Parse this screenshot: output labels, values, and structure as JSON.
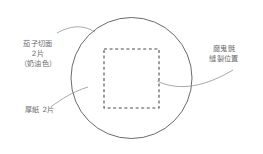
{
  "page": {
    "background_color": "#ffffff",
    "width": 263,
    "height": 154
  },
  "colors": {
    "stroke": "#595959",
    "dashed_stroke": "#4d4d4d",
    "leader": "#8c8c8c",
    "text": "#6b6b6b"
  },
  "labels": {
    "eggplant_slice": {
      "name": "茄子切面",
      "lines": [
        "茄子切面",
        "2片",
        "（奶油色）"
      ],
      "line1": "茄子切面",
      "line2": "2片",
      "line3": "（奶油色）"
    },
    "cardboard": {
      "name": "厚紙",
      "lines": [
        "厚紙 2片"
      ],
      "line1": "厚紙 2片"
    },
    "velcro": {
      "name": "魔鬼氈",
      "lines": [
        "魔鬼氈",
        "縫製位置"
      ],
      "line1": "魔鬼氈",
      "line2": "縫製位置"
    }
  },
  "shapes": {
    "circle": {
      "name": "outer-circle",
      "cx": 131.5,
      "cy": 78,
      "r": 60.5,
      "stroke_width": 0.9
    },
    "dashed_square": {
      "name": "velcro-stitch-square",
      "x": 104,
      "y": 49,
      "width": 55,
      "height": 59,
      "stroke_width": 1.1,
      "dash": "3 2.6"
    }
  },
  "leaders": [
    {
      "name": "leader-eggplant",
      "path": "M 57 33 C 70 26 82 24 95 32"
    },
    {
      "name": "leader-cardboard",
      "path": "M 52 106 C 62 99 72 92 88 87"
    },
    {
      "name": "leader-velcro",
      "path": "M 157 81 C 180 92 206 86 233 70"
    }
  ]
}
